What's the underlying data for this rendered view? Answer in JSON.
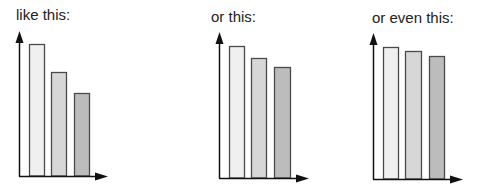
{
  "colors": {
    "bar_fills": [
      "#f0f0f0",
      "#d7d7d7",
      "#bcbcbc"
    ],
    "bar_stroke": "#4a4a4a",
    "axis": "#111111"
  },
  "panels": [
    {
      "caption": "like this:"
    },
    {
      "caption": "or this:"
    },
    {
      "caption": "or even this:"
    }
  ],
  "chart_data": [
    {
      "type": "bar",
      "title": "like this:",
      "categories": [
        "A",
        "B",
        "C"
      ],
      "values": [
        100,
        79,
        63
      ],
      "xlabel": "",
      "ylabel": "",
      "grid": false,
      "note": "relative heights, no axis ticks shown"
    },
    {
      "type": "bar",
      "title": "or this:",
      "categories": [
        "A",
        "B",
        "C"
      ],
      "values": [
        100,
        91,
        84
      ],
      "xlabel": "",
      "ylabel": "",
      "grid": false,
      "note": "relative heights, no axis ticks shown"
    },
    {
      "type": "bar",
      "title": "or even this:",
      "categories": [
        "A",
        "B",
        "C"
      ],
      "values": [
        100,
        97,
        93
      ],
      "xlabel": "",
      "ylabel": "",
      "grid": false,
      "note": "relative heights, no axis ticks shown"
    }
  ]
}
